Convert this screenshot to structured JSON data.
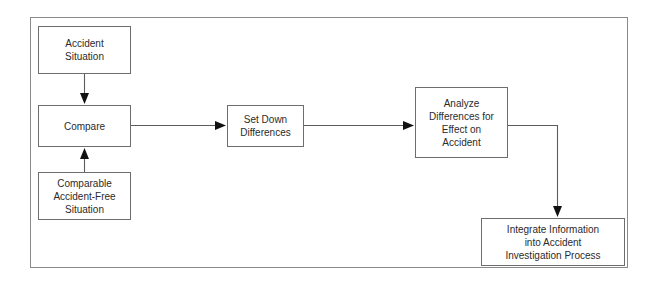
{
  "diagram": {
    "frame": {
      "name": "diagram-border"
    },
    "nodes": [
      {
        "id": "accident-situation",
        "label": "Accident\nSituation"
      },
      {
        "id": "compare",
        "label": "Compare"
      },
      {
        "id": "comparable-accident-free-situation",
        "label": "Comparable\nAccident-Free\nSituation"
      },
      {
        "id": "set-down-differences",
        "label": "Set Down\nDifferences"
      },
      {
        "id": "analyze-differences",
        "label": "Analyze\nDifferences for\nEffect on\nAccident"
      },
      {
        "id": "integrate-information",
        "label": "Integrate Information\ninto Accident\nInvestigation Process"
      }
    ],
    "connectors": [
      {
        "id": "accident-situation-to-compare",
        "from": "accident-situation",
        "to": "compare",
        "direction": "down"
      },
      {
        "id": "comparable-to-compare",
        "from": "comparable-accident-free-situation",
        "to": "compare",
        "direction": "up"
      },
      {
        "id": "compare-to-set-down",
        "from": "compare",
        "to": "set-down-differences",
        "direction": "right"
      },
      {
        "id": "set-down-to-analyze",
        "from": "set-down-differences",
        "to": "analyze-differences",
        "direction": "right"
      },
      {
        "id": "analyze-to-integrate",
        "from": "analyze-differences",
        "to": "integrate-information",
        "direction": "right-then-down"
      }
    ],
    "colors": {
      "node_border": "#6d6d6d",
      "frame_border": "#8a8a8a",
      "connector": "#5c5c5c",
      "text": "#2b2b2b",
      "background": "#ffffff"
    }
  }
}
